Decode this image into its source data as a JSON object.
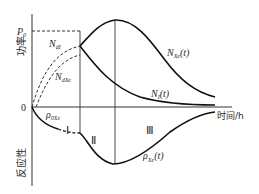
{
  "diagram": {
    "y_axis_label_top": "功率",
    "y_axis_label_bottom": "反应性",
    "x_axis_label": "时间/h",
    "origin_label": "0",
    "p0_label": {
      "main": "P",
      "sub": "0"
    },
    "curve_labels": {
      "n_d1": {
        "main": "N",
        "sub": "dI"
      },
      "n_dxe": {
        "main": "N",
        "sub": "dXe"
      },
      "n_xe": {
        "main": "N",
        "sub": "Xe",
        "suffix": "(t)"
      },
      "n_i": {
        "main": "N",
        "sub": "I",
        "suffix": "(t)"
      },
      "rho_0xe": {
        "main": "ρ",
        "sub": "0Xe"
      },
      "rho_xe": {
        "main": "ρ",
        "sub": "Xe",
        "suffix": "(t)"
      }
    },
    "regions": [
      "Ⅰ",
      "Ⅱ",
      "Ⅲ"
    ],
    "colors": {
      "line": "#1a1a1a",
      "text": "#2a2a2a",
      "background": "#ffffff"
    }
  }
}
